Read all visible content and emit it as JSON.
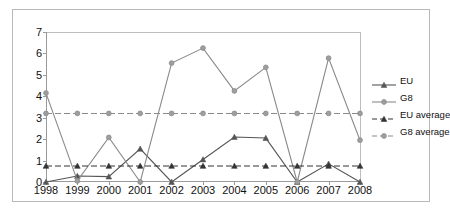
{
  "chart_data": {
    "type": "line",
    "title": "",
    "xlabel": "",
    "ylabel": "",
    "categories": [
      "1998",
      "1999",
      "2000",
      "2001",
      "2002",
      "2003",
      "2004",
      "2005",
      "2006",
      "2007",
      "2008"
    ],
    "ylim": [
      0,
      7
    ],
    "yticks": [
      0,
      1,
      2,
      3,
      4,
      5,
      6,
      7
    ],
    "grid": false,
    "legend_position": "right",
    "series": [
      {
        "name": "EU",
        "style": "solid",
        "marker": "triangle",
        "color": "#555555",
        "values": [
          0,
          0.28,
          0.25,
          1.55,
          0,
          1.05,
          2.1,
          2.05,
          0,
          0.85,
          0
        ]
      },
      {
        "name": "G8",
        "style": "solid",
        "marker": "circle",
        "color": "#8a8a8a",
        "values": [
          4.15,
          0.05,
          2.08,
          0,
          5.55,
          6.25,
          4.25,
          5.35,
          0,
          5.78,
          1.95
        ]
      },
      {
        "name": "EU average",
        "style": "dashed",
        "marker": "triangle",
        "color": "#333333",
        "constant": 0.75,
        "values": [
          0.75,
          0.75,
          0.75,
          0.75,
          0.75,
          0.75,
          0.75,
          0.75,
          0.75,
          0.75,
          0.75
        ]
      },
      {
        "name": "G8 average",
        "style": "dashed",
        "marker": "circle",
        "color": "#8a8a8a",
        "constant": 3.2,
        "values": [
          3.2,
          3.2,
          3.2,
          3.2,
          3.2,
          3.2,
          3.2,
          3.2,
          3.2,
          3.2,
          3.2
        ]
      }
    ]
  },
  "legend": {
    "items": [
      {
        "label": "EU"
      },
      {
        "label": "G8"
      },
      {
        "label": "EU average"
      },
      {
        "label": "G8 average"
      }
    ]
  }
}
